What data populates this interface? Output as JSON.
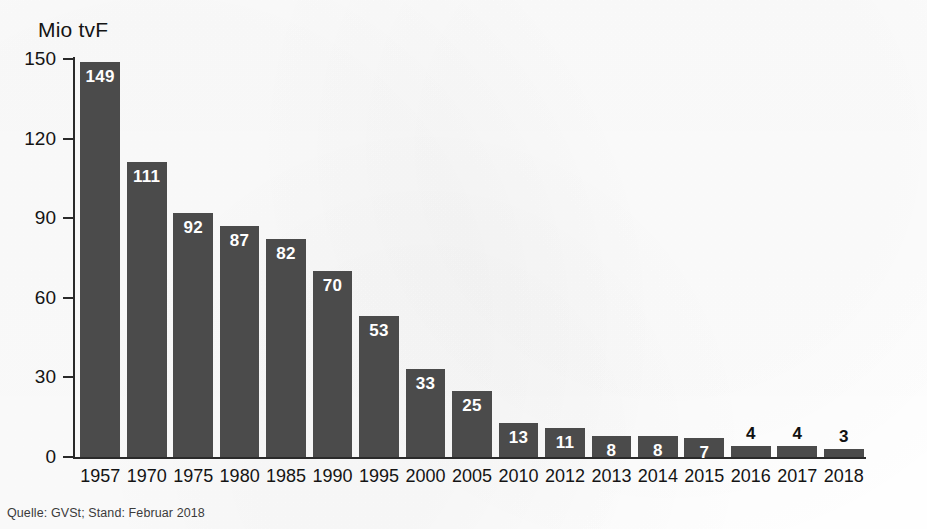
{
  "chart_data": {
    "type": "bar",
    "title": "",
    "ylabel": "Mio tvF",
    "xlabel": "",
    "ylim": [
      0,
      150
    ],
    "yticks": [
      0,
      30,
      60,
      90,
      120,
      150
    ],
    "grid": false,
    "legend": null,
    "categories": [
      "1957",
      "1970",
      "1975",
      "1980",
      "1985",
      "1990",
      "1995",
      "2000",
      "2005",
      "2010",
      "2012",
      "2013",
      "2014",
      "2015",
      "2016",
      "2017",
      "2018"
    ],
    "values": [
      149,
      111,
      92,
      87,
      82,
      70,
      53,
      33,
      25,
      13,
      11,
      8,
      8,
      7,
      4,
      4,
      3
    ],
    "label_placement": [
      "inside",
      "inside",
      "inside",
      "inside",
      "inside",
      "inside",
      "inside",
      "inside",
      "inside",
      "inside",
      "inside",
      "inside",
      "inside",
      "inside",
      "outside",
      "outside",
      "outside"
    ],
    "bar_color": "#4b4b4b",
    "inside_label_color": "#ffffff",
    "outside_label_color": "#111111",
    "axis_color": "#2a2a2a",
    "background_color": "#fefefe",
    "annotations": [
      "Quelle: GVSt; Stand: Februar 2018"
    ]
  },
  "axis": {
    "y_title": "Mio tvF",
    "y_ticks": [
      "150",
      "120",
      "90",
      "60",
      "30",
      "0"
    ],
    "x_ticks": [
      "1957",
      "1970",
      "1975",
      "1980",
      "1985",
      "1990",
      "1995",
      "2000",
      "2005",
      "2010",
      "2012",
      "2013",
      "2014",
      "2015",
      "2016",
      "2017",
      "2018"
    ]
  },
  "bars": [
    {
      "category": "1957",
      "value": "149"
    },
    {
      "category": "1970",
      "value": "111"
    },
    {
      "category": "1975",
      "value": "92"
    },
    {
      "category": "1980",
      "value": "87"
    },
    {
      "category": "1985",
      "value": "82"
    },
    {
      "category": "1990",
      "value": "70"
    },
    {
      "category": "1995",
      "value": "53"
    },
    {
      "category": "2000",
      "value": "33"
    },
    {
      "category": "2005",
      "value": "25"
    },
    {
      "category": "2010",
      "value": "13"
    },
    {
      "category": "2012",
      "value": "11"
    },
    {
      "category": "2013",
      "value": "8"
    },
    {
      "category": "2014",
      "value": "8"
    },
    {
      "category": "2015",
      "value": "7"
    },
    {
      "category": "2016",
      "value": "4"
    },
    {
      "category": "2017",
      "value": "4"
    },
    {
      "category": "2018",
      "value": "3"
    }
  ],
  "footer": {
    "source": "Quelle: GVSt; Stand: Februar 2018"
  }
}
